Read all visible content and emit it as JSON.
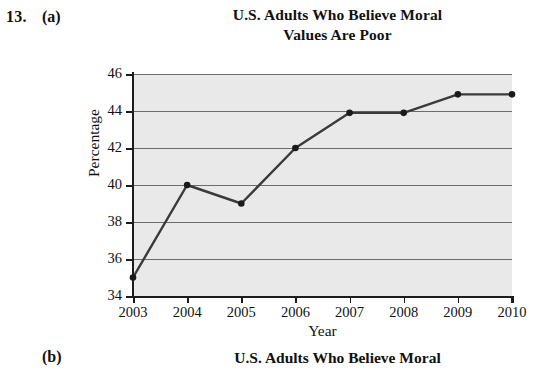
{
  "problem": {
    "number": "13.",
    "part_a": "(a)",
    "part_b": "(b)"
  },
  "title_a_line1": "U.S. Adults Who Believe Moral",
  "title_a_line2": "Values Are Poor",
  "title_b_line1": "U.S. Adults Who Believe Moral",
  "colors": {
    "plot_background": "#e9e9e9",
    "gridline": "#6d6d6d",
    "axis": "#1c1c1c",
    "series_line": "#3a3a3a",
    "marker": "#1a1a1a",
    "text": "#111111"
  },
  "chart_data": {
    "type": "line",
    "title": "U.S. Adults Who Believe Moral Values Are Poor",
    "xlabel": "Year",
    "ylabel": "Percentage",
    "categories": [
      "2003",
      "2004",
      "2005",
      "2006",
      "2007",
      "2008",
      "2009",
      "2010"
    ],
    "x": [
      2003,
      2004,
      2005,
      2006,
      2007,
      2008,
      2009,
      2010
    ],
    "values": [
      35,
      40,
      39,
      42,
      43.9,
      43.9,
      44.9,
      44.9
    ],
    "series": [
      {
        "name": "Percentage who believe moral values are poor",
        "values": [
          35,
          40,
          39,
          42,
          43.9,
          43.9,
          44.9,
          44.9
        ]
      }
    ],
    "ylim": [
      34,
      46
    ],
    "xlim": [
      2003,
      2010
    ],
    "yticks": [
      34,
      36,
      38,
      40,
      42,
      44,
      46
    ],
    "ytick_labels": [
      "34",
      "36",
      "38",
      "40",
      "42",
      "44",
      "46"
    ],
    "xticks": [
      2003,
      2004,
      2005,
      2006,
      2007,
      2008,
      2009,
      2010
    ],
    "xtick_labels": [
      "2003",
      "2004",
      "2005",
      "2006",
      "2007",
      "2008",
      "2009",
      "2010"
    ],
    "grid": true,
    "grid_axis": "y",
    "legend": false,
    "legend_position": "none",
    "markers": true,
    "marker_style": "circle"
  }
}
